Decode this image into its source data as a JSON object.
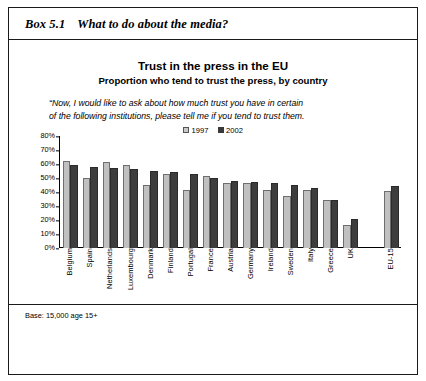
{
  "box": {
    "label": "Box 5.1",
    "heading": "What to do about the media?"
  },
  "chart": {
    "title": "Trust in the press in the EU",
    "subtitle": "Proportion who tend to trust the press, by country",
    "quote_line1": "“Now, I would like to ask about how much trust you have in certain",
    "quote_line2": "of the following institutions, please tell me if you tend to trust them.",
    "legend": [
      {
        "label": "1997",
        "color": "#c0c0c0"
      },
      {
        "label": "2002",
        "color": "#3d3d3d"
      }
    ]
  },
  "footer": {
    "base_note": "Base: 15,000 age 15+"
  },
  "chart_data": {
    "type": "bar",
    "title": "Trust in the press in the EU",
    "subtitle": "Proportion who tend to trust the press, by country",
    "xlabel": "",
    "ylabel": "",
    "ylim": [
      0,
      80
    ],
    "ytick_labels": [
      "80%",
      "70%",
      "60%",
      "50%",
      "40%",
      "30%",
      "20%",
      "10%",
      "0%"
    ],
    "ytick_values": [
      80,
      70,
      60,
      50,
      40,
      30,
      20,
      10,
      0
    ],
    "grid": false,
    "legend_position": "top-center",
    "categories": [
      "Belgium",
      "Spain",
      "Netherlands",
      "Luxembourg",
      "Denmark",
      "Finland",
      "Portugal",
      "France",
      "Austria",
      "Germany",
      "Ireland",
      "Sweden",
      "Italy",
      "Greece",
      "UK",
      "",
      "EU-15"
    ],
    "series": [
      {
        "name": "1997",
        "color": "#c0c0c0",
        "values": [
          62,
          50,
          61,
          59.5,
          45,
          53,
          41,
          51,
          46.5,
          46,
          41,
          37,
          41,
          34.5,
          16,
          null,
          40.5
        ]
      },
      {
        "name": "2002",
        "color": "#3d3d3d",
        "values": [
          59,
          58,
          57,
          56,
          55,
          54,
          53,
          50,
          47.5,
          47,
          46.5,
          45,
          42.5,
          34.5,
          20.5,
          null,
          44
        ]
      }
    ]
  }
}
